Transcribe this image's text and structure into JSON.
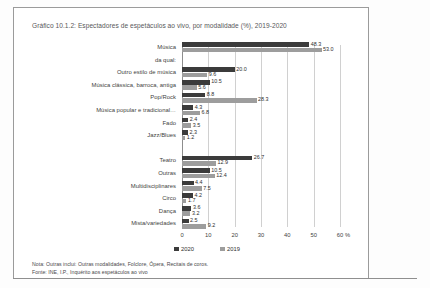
{
  "chart_data": {
    "type": "bar",
    "orientation": "horizontal",
    "title": "Gráfico 10.1.2: Espectadores de espetáculos ao vivo, por modalidade (%), 2019-2020",
    "xlabel": "%",
    "ylabel": "",
    "xlim": [
      0,
      60
    ],
    "xticks": [
      0,
      10,
      20,
      30,
      40,
      50,
      60
    ],
    "xtick_labels": [
      "0",
      "10",
      "20",
      "30",
      "40",
      "50",
      "60"
    ],
    "x_unit_label": "%",
    "grid": true,
    "legend_position": "bottom",
    "categories": [
      "Música",
      "da qual:",
      "Outro estilo de música",
      "Música clássica, barroca, antiga",
      "Pop/Rock",
      "Música popular e tradicional…",
      "Fado",
      "Jazz/Blues",
      "",
      "Teatro",
      "Outras",
      "Multidisciplinares",
      "Circo",
      "Dança",
      "Mista/variedades"
    ],
    "series": [
      {
        "name": "2020",
        "color": "#3b3b3b",
        "values": [
          48.3,
          null,
          20.0,
          10.5,
          8.8,
          4.3,
          2.4,
          2.3,
          null,
          26.7,
          10.5,
          4.4,
          4.2,
          3.6,
          2.5
        ]
      },
      {
        "name": "2019",
        "color": "#9d9d9d",
        "values": [
          53.0,
          null,
          9.6,
          5.6,
          28.3,
          6.8,
          3.5,
          1.2,
          null,
          12.9,
          12.4,
          7.5,
          1.7,
          3.2,
          9.2
        ]
      }
    ],
    "legend": [
      "2020",
      "2019"
    ]
  },
  "notes": {
    "note": "Nota: Outras inclui: Outras modalidades, Folclore, Ópera, Recitais de coros.",
    "source": "Fonte: INE, I.P., Inquérito aos espetáculos ao vivo"
  }
}
